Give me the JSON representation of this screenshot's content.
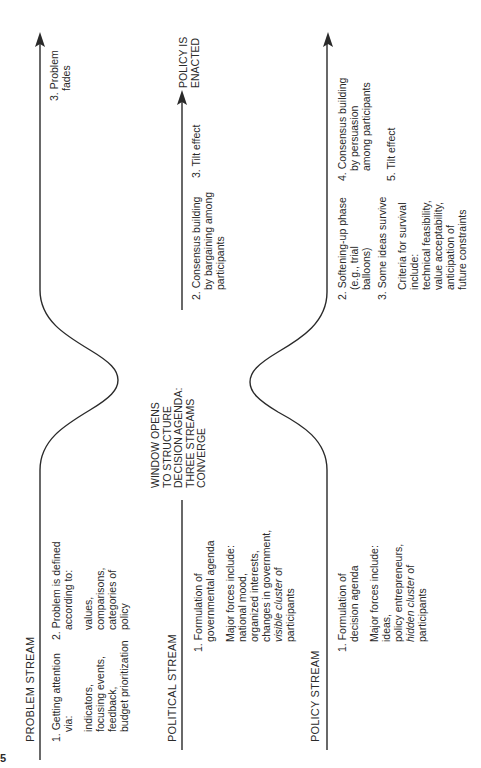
{
  "figure": {
    "page_fragment": "5",
    "orientation": "rotated 90 degrees counter-clockwise",
    "line_color": "#2a2a2a"
  },
  "streams": {
    "problem": {
      "title": "PROBLEM STREAM",
      "step1": {
        "label": "1. Getting attention",
        "label2": "via:",
        "details": [
          "indicators,",
          "focusing events,",
          "feedback,",
          "budget prioritization"
        ]
      },
      "step2": {
        "label": "2. Problem is defined",
        "label2": "according to:",
        "details": [
          "values,",
          "comparisons,",
          "categories of",
          "policy"
        ]
      },
      "step3": {
        "label": "3. Problem",
        "label2": "fades"
      }
    },
    "political": {
      "title": "POLITICAL STREAM",
      "step1": {
        "label": "1. Formulation of",
        "label2": "governmental agenda"
      },
      "forces": [
        "Major forces include:",
        "national mood,",
        "organized interests,",
        "changes in government,"
      ],
      "forces_italic": "visible cluster",
      "forces_italic_tail": " of",
      "forces_last": "participants",
      "step2": {
        "label": "2. Consensus building",
        "label2": "by bargaining among",
        "label3": "participants"
      },
      "step3": "3. Tilt effect",
      "outcome": [
        "POLICY IS",
        "ENACTED"
      ]
    },
    "policy": {
      "title": "POLICY STREAM",
      "step1": {
        "label": "1. Formulation of",
        "label2": "decision agenda"
      },
      "forces": [
        "Major forces include:",
        "ideas,",
        "policy entrepreneurs,"
      ],
      "forces_italic": "hidden cluster",
      "forces_italic_tail": " of",
      "forces_last": "participants",
      "step2": {
        "label": "2. Softening-up phase",
        "label2": "(e.g., trial",
        "label3": "balloons)"
      },
      "step3": "3. Some ideas survive",
      "criteria": [
        "Criteria for survival",
        "include:",
        "technical feasibility,",
        "value acceptability,",
        "anticipation of",
        "future constraints"
      ],
      "step4": {
        "label": "4. Consensus building",
        "label2": "by persuasion",
        "label3": "among participants"
      },
      "step5": "5. Tilt effect"
    }
  },
  "window": {
    "lines": [
      "WINDOW OPENS",
      "TO STRUCTURE",
      "DECISION AGENDA:",
      "THREE STREAMS",
      "CONVERGE"
    ]
  }
}
